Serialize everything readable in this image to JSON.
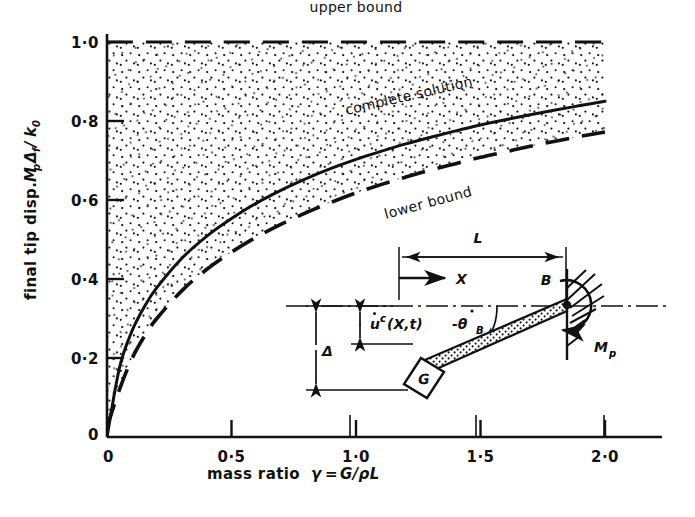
{
  "figure": {
    "background_color": "#ffffff",
    "ink_color": "#111111"
  },
  "chart_data": {
    "type": "line",
    "title": "",
    "xlabel": "mass ratio  γ = G/ρL",
    "ylabel": "final tip disp.  MₚΔf/k₀",
    "xlim": [
      0,
      2.05
    ],
    "ylim": [
      0,
      1.05
    ],
    "grid": false,
    "legend_position": "inline-annotations",
    "x_ticks": [
      {
        "value": 0,
        "label": "0"
      },
      {
        "value": 0.5,
        "label": "0·5"
      },
      {
        "value": 1.0,
        "label": "1·0"
      },
      {
        "value": 1.5,
        "label": "1·5"
      },
      {
        "value": 2.0,
        "label": "2·0"
      }
    ],
    "y_ticks": [
      {
        "value": 0,
        "label": "0"
      },
      {
        "value": 0.2,
        "label": "0·2"
      },
      {
        "value": 0.4,
        "label": "0·4"
      },
      {
        "value": 0.6,
        "label": "0·6"
      },
      {
        "value": 0.8,
        "label": "0·8"
      },
      {
        "value": 1.0,
        "label": "1·0"
      }
    ],
    "shaded_region": {
      "description": "stippled area between lower bound curve and upper bound line",
      "fill": "stipple-dots",
      "dot_color": "#111111"
    },
    "series": [
      {
        "name": "upper bound",
        "label": "upper bound",
        "style": "dashed",
        "x": [
          0.0,
          2.0
        ],
        "values": [
          1.0,
          1.0
        ],
        "label_x": 1.0,
        "label_y": 1.055
      },
      {
        "name": "complete solution",
        "label": "complete solution",
        "style": "solid",
        "x": [
          0.0,
          0.05,
          0.1,
          0.15,
          0.2,
          0.3,
          0.4,
          0.5,
          0.6,
          0.7,
          0.8,
          0.9,
          1.0,
          1.1,
          1.2,
          1.3,
          1.4,
          1.5,
          1.6,
          1.7,
          1.8,
          1.9,
          2.0
        ],
        "values": [
          0.0,
          0.175,
          0.268,
          0.33,
          0.378,
          0.452,
          0.508,
          0.553,
          0.592,
          0.625,
          0.654,
          0.68,
          0.703,
          0.723,
          0.742,
          0.759,
          0.775,
          0.79,
          0.803,
          0.816,
          0.828,
          0.839,
          0.85
        ],
        "label_x": 1.09,
        "label_y": 0.795
      },
      {
        "name": "lower bound",
        "label": "lower bound",
        "style": "dashed",
        "x": [
          0.0,
          0.05,
          0.1,
          0.15,
          0.2,
          0.3,
          0.4,
          0.5,
          0.6,
          0.7,
          0.8,
          0.9,
          1.0,
          1.1,
          1.2,
          1.3,
          1.4,
          1.5,
          1.6,
          1.7,
          1.8,
          1.9,
          2.0
        ],
        "values": [
          0.025,
          0.12,
          0.198,
          0.255,
          0.3,
          0.37,
          0.424,
          0.468,
          0.506,
          0.539,
          0.568,
          0.594,
          0.618,
          0.639,
          0.658,
          0.676,
          0.692,
          0.708,
          0.722,
          0.736,
          0.749,
          0.761,
          0.772
        ],
        "label_x": 1.12,
        "label_y": 0.618
      }
    ]
  },
  "annotations": {
    "upper_bound_label": "upper bound",
    "complete_solution_label": "complete solution",
    "lower_bound_label": "lower bound"
  },
  "axis": {
    "x_title_prefix": "mass ratio",
    "x_title_symbol": "γ",
    "x_title_equals": "=",
    "x_title_expr": "G/ρL",
    "y_title_prefix": "final tip disp.",
    "y_title_num_M": "M",
    "y_title_num_M_sub": "p",
    "y_title_num_D": "Δ",
    "y_title_num_D_sub": "f",
    "y_title_slash": "/",
    "y_title_den_k": "k",
    "y_title_den_k_sub": "0"
  },
  "inset": {
    "name": "cantilever-beam-free-body-diagram",
    "labels": {
      "length": "L",
      "axial_coordinate": "X",
      "transverse_velocity": "u",
      "transverse_velocity_sup": "c",
      "transverse_velocity_args": "(X,t)",
      "tip_rotation_rate": "-θ",
      "tip_rotation_rate_sub": "B",
      "final_deflection": "Δ",
      "support_point": "B",
      "plastic_moment": "M",
      "plastic_moment_sub": "p",
      "mass_block": "G"
    }
  }
}
